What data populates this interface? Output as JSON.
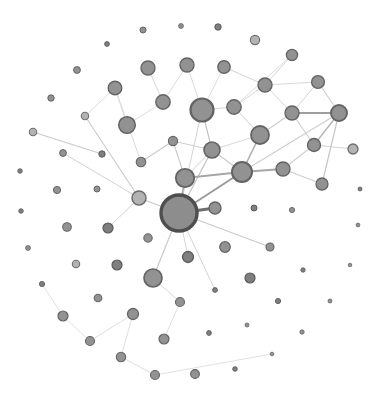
{
  "figure": {
    "background": "#ffffff",
    "canvas_width": 380,
    "canvas_height": 401,
    "kind": "node-link network graph, no text labels"
  },
  "chart_data": {
    "type": "network",
    "styles": {
      "std": {
        "fill": "#929292",
        "stroke": "#646464"
      },
      "ring": {
        "fill": "#b3b3b3",
        "stroke": "#6e6e6e"
      },
      "dark": {
        "fill": "#7f7f7f",
        "stroke": "#5a5a5a"
      },
      "hub": {
        "fill": "#8d8d8d",
        "stroke": "#4e4e4e"
      }
    },
    "nodes": [
      {
        "id": "n1",
        "x": 143,
        "y": 30,
        "r": 3.0,
        "sw": 1.0,
        "kind": "std"
      },
      {
        "id": "n2",
        "x": 181,
        "y": 26,
        "r": 2.4,
        "sw": 0.9,
        "kind": "std"
      },
      {
        "id": "n3",
        "x": 218,
        "y": 27,
        "r": 3.2,
        "sw": 1.0,
        "kind": "dark"
      },
      {
        "id": "n4",
        "x": 107,
        "y": 44,
        "r": 2.4,
        "sw": 0.9,
        "kind": "dark"
      },
      {
        "id": "n5",
        "x": 255,
        "y": 40,
        "r": 4.6,
        "sw": 1.2,
        "kind": "ring"
      },
      {
        "id": "n6",
        "x": 292,
        "y": 55,
        "r": 5.6,
        "sw": 1.3,
        "kind": "std"
      },
      {
        "id": "n7",
        "x": 77,
        "y": 70,
        "r": 3.4,
        "sw": 1.0,
        "kind": "std"
      },
      {
        "id": "n8",
        "x": 148,
        "y": 68,
        "r": 7.0,
        "sw": 1.4,
        "kind": "std"
      },
      {
        "id": "n9",
        "x": 187,
        "y": 65,
        "r": 7.0,
        "sw": 1.4,
        "kind": "std"
      },
      {
        "id": "n10",
        "x": 224,
        "y": 67,
        "r": 6.2,
        "sw": 1.4,
        "kind": "std"
      },
      {
        "id": "n11",
        "x": 265,
        "y": 85,
        "r": 7.0,
        "sw": 1.4,
        "kind": "std"
      },
      {
        "id": "n12",
        "x": 318,
        "y": 82,
        "r": 6.4,
        "sw": 1.4,
        "kind": "std"
      },
      {
        "id": "n13",
        "x": 115,
        "y": 88,
        "r": 6.8,
        "sw": 1.4,
        "kind": "std"
      },
      {
        "id": "n14",
        "x": 163,
        "y": 102,
        "r": 7.2,
        "sw": 1.4,
        "kind": "std"
      },
      {
        "id": "n15",
        "x": 51,
        "y": 98,
        "r": 3.2,
        "sw": 1.0,
        "kind": "std"
      },
      {
        "id": "n16",
        "x": 202,
        "y": 110,
        "r": 11.5,
        "sw": 2.2,
        "kind": "std"
      },
      {
        "id": "n17",
        "x": 234,
        "y": 107,
        "r": 7.2,
        "sw": 1.4,
        "kind": "std"
      },
      {
        "id": "n18",
        "x": 292,
        "y": 113,
        "r": 7.0,
        "sw": 1.4,
        "kind": "std"
      },
      {
        "id": "n19",
        "x": 339,
        "y": 113,
        "r": 8.0,
        "sw": 1.9,
        "kind": "std"
      },
      {
        "id": "n20",
        "x": 85,
        "y": 116,
        "r": 3.7,
        "sw": 1.1,
        "kind": "ring"
      },
      {
        "id": "n21",
        "x": 127,
        "y": 125,
        "r": 8.3,
        "sw": 1.5,
        "kind": "std"
      },
      {
        "id": "n22",
        "x": 33,
        "y": 132,
        "r": 3.7,
        "sw": 1.1,
        "kind": "ring"
      },
      {
        "id": "n23",
        "x": 173,
        "y": 141,
        "r": 4.6,
        "sw": 1.1,
        "kind": "std"
      },
      {
        "id": "n24",
        "x": 260,
        "y": 135,
        "r": 9.0,
        "sw": 1.8,
        "kind": "std"
      },
      {
        "id": "n25",
        "x": 314,
        "y": 145,
        "r": 6.5,
        "sw": 1.4,
        "kind": "std"
      },
      {
        "id": "n26",
        "x": 353,
        "y": 149,
        "r": 5.0,
        "sw": 1.3,
        "kind": "ring"
      },
      {
        "id": "n27",
        "x": 63,
        "y": 153,
        "r": 3.4,
        "sw": 1.0,
        "kind": "std"
      },
      {
        "id": "n28",
        "x": 102,
        "y": 154,
        "r": 3.2,
        "sw": 1.0,
        "kind": "dark"
      },
      {
        "id": "n29",
        "x": 141,
        "y": 162,
        "r": 4.8,
        "sw": 1.1,
        "kind": "std"
      },
      {
        "id": "n30",
        "x": 185,
        "y": 178,
        "r": 9.2,
        "sw": 1.8,
        "kind": "std"
      },
      {
        "id": "n31",
        "x": 242,
        "y": 172,
        "r": 10.0,
        "sw": 2.0,
        "kind": "std"
      },
      {
        "id": "n32",
        "x": 283,
        "y": 169,
        "r": 7.0,
        "sw": 1.4,
        "kind": "std"
      },
      {
        "id": "n33",
        "x": 20,
        "y": 171,
        "r": 2.3,
        "sw": 0.8,
        "kind": "dark"
      },
      {
        "id": "n34",
        "x": 212,
        "y": 150,
        "r": 8.0,
        "sw": 1.6,
        "kind": "std"
      },
      {
        "id": "n35",
        "x": 322,
        "y": 184,
        "r": 6.0,
        "sw": 1.3,
        "kind": "std"
      },
      {
        "id": "n36",
        "x": 139,
        "y": 198,
        "r": 7.0,
        "sw": 1.5,
        "kind": "ring"
      },
      {
        "id": "n37",
        "x": 97,
        "y": 189,
        "r": 3.0,
        "sw": 1.0,
        "kind": "std"
      },
      {
        "id": "n38",
        "x": 57,
        "y": 190,
        "r": 3.6,
        "sw": 1.0,
        "kind": "std"
      },
      {
        "id": "n39",
        "x": 360,
        "y": 189,
        "r": 2.0,
        "sw": 0.8,
        "kind": "dark"
      },
      {
        "id": "n40",
        "x": 179,
        "y": 213,
        "r": 18.0,
        "sw": 3.4,
        "kind": "hub"
      },
      {
        "id": "n41",
        "x": 215,
        "y": 208,
        "r": 6.0,
        "sw": 1.4,
        "kind": "std"
      },
      {
        "id": "n42",
        "x": 254,
        "y": 208,
        "r": 3.0,
        "sw": 1.0,
        "kind": "dark"
      },
      {
        "id": "n43",
        "x": 292,
        "y": 210,
        "r": 2.6,
        "sw": 0.9,
        "kind": "std"
      },
      {
        "id": "n44",
        "x": 21,
        "y": 211,
        "r": 2.3,
        "sw": 0.8,
        "kind": "dark"
      },
      {
        "id": "n45",
        "x": 67,
        "y": 227,
        "r": 4.3,
        "sw": 1.1,
        "kind": "std"
      },
      {
        "id": "n46",
        "x": 108,
        "y": 228,
        "r": 5.0,
        "sw": 1.2,
        "kind": "dark"
      },
      {
        "id": "n47",
        "x": 225,
        "y": 247,
        "r": 5.3,
        "sw": 1.2,
        "kind": "std"
      },
      {
        "id": "n48",
        "x": 270,
        "y": 247,
        "r": 4.0,
        "sw": 1.1,
        "kind": "std"
      },
      {
        "id": "n49",
        "x": 148,
        "y": 238,
        "r": 4.2,
        "sw": 1.1,
        "kind": "std"
      },
      {
        "id": "n50",
        "x": 188,
        "y": 257,
        "r": 5.5,
        "sw": 1.3,
        "kind": "dark"
      },
      {
        "id": "n51",
        "x": 358,
        "y": 225,
        "r": 1.9,
        "sw": 0.8,
        "kind": "std"
      },
      {
        "id": "n52",
        "x": 350,
        "y": 265,
        "r": 1.8,
        "sw": 0.8,
        "kind": "std"
      },
      {
        "id": "n53",
        "x": 303,
        "y": 270,
        "r": 2.2,
        "sw": 0.8,
        "kind": "dark"
      },
      {
        "id": "n54",
        "x": 28,
        "y": 248,
        "r": 2.4,
        "sw": 0.9,
        "kind": "std"
      },
      {
        "id": "n55",
        "x": 117,
        "y": 265,
        "r": 5.0,
        "sw": 1.2,
        "kind": "dark"
      },
      {
        "id": "n56",
        "x": 76,
        "y": 264,
        "r": 3.7,
        "sw": 1.1,
        "kind": "ring"
      },
      {
        "id": "n57",
        "x": 153,
        "y": 278,
        "r": 9.0,
        "sw": 1.7,
        "kind": "std"
      },
      {
        "id": "n58",
        "x": 250,
        "y": 278,
        "r": 5.0,
        "sw": 1.2,
        "kind": "dark"
      },
      {
        "id": "n59",
        "x": 42,
        "y": 284,
        "r": 2.6,
        "sw": 0.9,
        "kind": "dark"
      },
      {
        "id": "n60",
        "x": 98,
        "y": 298,
        "r": 3.8,
        "sw": 1.1,
        "kind": "std"
      },
      {
        "id": "n61",
        "x": 215,
        "y": 290,
        "r": 2.4,
        "sw": 0.9,
        "kind": "dark"
      },
      {
        "id": "n62",
        "x": 180,
        "y": 302,
        "r": 4.5,
        "sw": 1.1,
        "kind": "std"
      },
      {
        "id": "n63",
        "x": 278,
        "y": 301,
        "r": 2.6,
        "sw": 0.9,
        "kind": "dark"
      },
      {
        "id": "n64",
        "x": 330,
        "y": 301,
        "r": 2.0,
        "sw": 0.8,
        "kind": "std"
      },
      {
        "id": "n66",
        "x": 63,
        "y": 316,
        "r": 5.0,
        "sw": 1.2,
        "kind": "std"
      },
      {
        "id": "n67",
        "x": 133,
        "y": 314,
        "r": 5.5,
        "sw": 1.3,
        "kind": "std"
      },
      {
        "id": "n68",
        "x": 247,
        "y": 325,
        "r": 2.0,
        "sw": 0.8,
        "kind": "std"
      },
      {
        "id": "n69",
        "x": 209,
        "y": 333,
        "r": 2.4,
        "sw": 0.9,
        "kind": "dark"
      },
      {
        "id": "n70",
        "x": 302,
        "y": 332,
        "r": 2.2,
        "sw": 0.8,
        "kind": "std"
      },
      {
        "id": "n71",
        "x": 90,
        "y": 341,
        "r": 4.5,
        "sw": 1.1,
        "kind": "std"
      },
      {
        "id": "n72",
        "x": 164,
        "y": 339,
        "r": 5.0,
        "sw": 1.2,
        "kind": "std"
      },
      {
        "id": "n73",
        "x": 121,
        "y": 357,
        "r": 4.7,
        "sw": 1.1,
        "kind": "std"
      },
      {
        "id": "n74",
        "x": 272,
        "y": 354,
        "r": 1.8,
        "sw": 0.8,
        "kind": "std"
      },
      {
        "id": "n75",
        "x": 235,
        "y": 369,
        "r": 2.3,
        "sw": 0.9,
        "kind": "dark"
      },
      {
        "id": "n76",
        "x": 155,
        "y": 375,
        "r": 4.5,
        "sw": 1.1,
        "kind": "std"
      },
      {
        "id": "n77",
        "x": 195,
        "y": 374,
        "r": 4.4,
        "sw": 1.1,
        "kind": "std"
      }
    ],
    "edges": [
      [
        "n40",
        "n41",
        3.2,
        "#6f6f6f"
      ],
      [
        "n40",
        "n31",
        2.0,
        "#9b9b9b"
      ],
      [
        "n30",
        "n31",
        1.8,
        "#a6a6a6"
      ],
      [
        "n31",
        "n32",
        1.8,
        "#a6a6a6"
      ],
      [
        "n19",
        "n18",
        2.0,
        "#9e9e9e"
      ],
      [
        "n31",
        "n24",
        1.6,
        "#aeaeae"
      ],
      [
        "n40",
        "n30",
        1.6,
        "#a9a9a9"
      ],
      [
        "n25",
        "n19",
        1.4,
        "#b5b5b5"
      ],
      [
        "n40",
        "n34",
        1.2,
        "#c3c3c3"
      ],
      [
        "n34",
        "n16",
        1.2,
        "#c3c3c3"
      ],
      [
        "n34",
        "n31",
        1.1,
        "#cacaca"
      ],
      [
        "n30",
        "n34",
        1.0,
        "#d2d2d2"
      ],
      [
        "n23",
        "n34",
        1.0,
        "#cecece"
      ],
      [
        "n30",
        "n23",
        1.1,
        "#c9c9c9"
      ],
      [
        "n29",
        "n23",
        1.1,
        "#c9c9c9"
      ],
      [
        "n40",
        "n16",
        1.0,
        "#d2d2d2"
      ],
      [
        "n40",
        "n36",
        1.1,
        "#c9c9c9"
      ],
      [
        "n40",
        "n48",
        1.2,
        "#c9c9c9"
      ],
      [
        "n40",
        "n57",
        1.2,
        "#cacaca"
      ],
      [
        "n40",
        "n50",
        1.0,
        "#d6d6d6"
      ],
      [
        "n40",
        "n61",
        1.0,
        "#d4d4d4"
      ],
      [
        "n36",
        "n20",
        1.1,
        "#cacaca"
      ],
      [
        "n22",
        "n28",
        1.1,
        "#cacaca"
      ],
      [
        "n36",
        "n27",
        1.0,
        "#d2d2d2"
      ],
      [
        "n36",
        "n46",
        1.0,
        "#d2d2d2"
      ],
      [
        "n19",
        "n35",
        1.2,
        "#c6c6c6"
      ],
      [
        "n19",
        "n12",
        1.1,
        "#cecece"
      ],
      [
        "n19",
        "n31",
        1.1,
        "#cecece"
      ],
      [
        "n32",
        "n25",
        1.1,
        "#cecece"
      ],
      [
        "n32",
        "n35",
        1.1,
        "#cecece"
      ],
      [
        "n25",
        "n26",
        1.0,
        "#d4d4d4"
      ],
      [
        "n25",
        "n18",
        1.1,
        "#cecece"
      ],
      [
        "n24",
        "n18",
        1.1,
        "#cecece"
      ],
      [
        "n24",
        "n17",
        1.0,
        "#d2d2d2"
      ],
      [
        "n24",
        "n34",
        1.0,
        "#d8d8d8"
      ],
      [
        "n11",
        "n18",
        1.0,
        "#d4d4d4"
      ],
      [
        "n11",
        "n12",
        1.0,
        "#d8d8d8"
      ],
      [
        "n11",
        "n10",
        1.0,
        "#d4d4d4"
      ],
      [
        "n11",
        "n6",
        1.0,
        "#d4d4d4"
      ],
      [
        "n11",
        "n17",
        1.0,
        "#d8d8d8"
      ],
      [
        "n12",
        "n18",
        1.0,
        "#d6d6d6"
      ],
      [
        "n16",
        "n17",
        1.0,
        "#d6d6d6"
      ],
      [
        "n16",
        "n9",
        1.0,
        "#dadada"
      ],
      [
        "n16",
        "n10",
        1.0,
        "#dcdcdc"
      ],
      [
        "n17",
        "n6",
        1.0,
        "#dcdcdc"
      ],
      [
        "n14",
        "n8",
        1.0,
        "#d8d8d8"
      ],
      [
        "n14",
        "n9",
        1.0,
        "#dcdcdc"
      ],
      [
        "n14",
        "n21",
        1.0,
        "#dedede"
      ],
      [
        "n13",
        "n20",
        1.0,
        "#dedede"
      ],
      [
        "n13",
        "n21",
        1.0,
        "#dedede"
      ],
      [
        "n29",
        "n13",
        1.0,
        "#dadada"
      ],
      [
        "n57",
        "n62",
        1.0,
        "#d8d8d8"
      ],
      [
        "n62",
        "n72",
        1.0,
        "#dedede"
      ],
      [
        "n67",
        "n71",
        1.0,
        "#e0e0e0"
      ],
      [
        "n67",
        "n73",
        1.0,
        "#e0e0e0"
      ],
      [
        "n73",
        "n76",
        1.0,
        "#dedede"
      ],
      [
        "n66",
        "n59",
        1.0,
        "#e2e2e2"
      ],
      [
        "n66",
        "n71",
        1.0,
        "#e2e2e2"
      ],
      [
        "n76",
        "n74",
        1.0,
        "#e2e2e2"
      ]
    ]
  }
}
